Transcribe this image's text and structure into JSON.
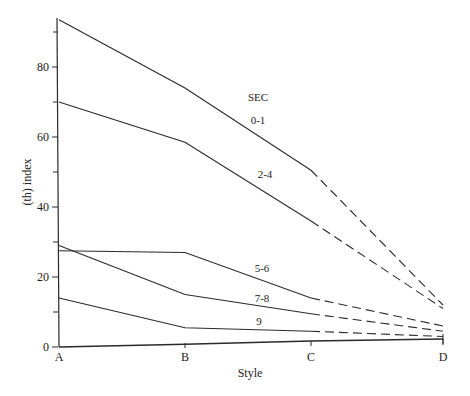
{
  "chart_data": {
    "type": "line",
    "title": "",
    "xlabel": "Style",
    "ylabel": "(th) index",
    "categories": [
      "A",
      "B",
      "C",
      "D"
    ],
    "ylim": [
      0,
      95
    ],
    "yticks": [
      0,
      20,
      40,
      60,
      80
    ],
    "minor_yticks": [
      10,
      30,
      50,
      70,
      90
    ],
    "grid": false,
    "legend": {
      "title": "SEC",
      "position": "inline labels near lines"
    },
    "segment_style": {
      "A-C": "solid",
      "C-D": "dashed"
    },
    "series": [
      {
        "name": "0-1",
        "values": [
          93.5,
          74,
          50.5,
          12
        ]
      },
      {
        "name": "2-4",
        "values": [
          70,
          58.5,
          36,
          11
        ]
      },
      {
        "name": "5-6",
        "values": [
          27.5,
          27,
          14,
          6
        ]
      },
      {
        "name": "7-8",
        "values": [
          29,
          15,
          9.5,
          4.5
        ]
      },
      {
        "name": "9",
        "values": [
          14,
          5.5,
          4.5,
          3
        ]
      },
      {
        "name": "",
        "values": [
          0,
          0.8,
          1.7,
          2.3
        ]
      }
    ]
  },
  "labels": {
    "legend_title": "SEC",
    "xlabel": "Style",
    "ylabel": "(th) index",
    "x_ticks": [
      "A",
      "B",
      "C",
      "D"
    ],
    "y_ticks": [
      "0",
      "20",
      "40",
      "60",
      "80"
    ],
    "series_labels": [
      "0-1",
      "2-4",
      "5-6",
      "7-8",
      "9"
    ]
  },
  "colors": {
    "line": "#2a2a2a",
    "text": "#222222",
    "background": "#ffffff"
  }
}
